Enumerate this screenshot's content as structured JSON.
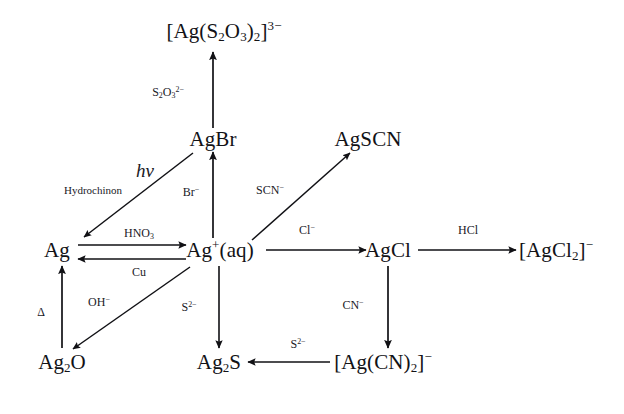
{
  "diagram": {
    "background_color": "#ffffff",
    "stroke_color": "#111115",
    "nodes": [
      {
        "id": "thio",
        "label": "[Ag(S2O3)2]3-",
        "html": "[Ag(S<sub>2</sub>O<sub>3</sub>)<sub>2</sub>]<sup>3−</sup>",
        "x": 224,
        "y": 31
      },
      {
        "id": "agbr",
        "label": "AgBr",
        "html": "AgBr",
        "x": 213,
        "y": 139
      },
      {
        "id": "agscn",
        "label": "AgSCN",
        "html": "AgSCN",
        "x": 368,
        "y": 139
      },
      {
        "id": "ag",
        "label": "Ag",
        "html": "Ag",
        "x": 57,
        "y": 250
      },
      {
        "id": "agaq",
        "label": "Ag+(aq)",
        "html": "Ag<sup>+</sup>(aq)",
        "x": 220,
        "y": 250
      },
      {
        "id": "agcl",
        "label": "AgCl",
        "html": "AgCl",
        "x": 388,
        "y": 250
      },
      {
        "id": "agcl2",
        "label": "[AgCl2]-",
        "html": "[AgCl<sub>2</sub>]<sup>−</sup>",
        "x": 556,
        "y": 250
      },
      {
        "id": "ag2o",
        "label": "Ag2O",
        "html": "Ag<sub>2</sub>O",
        "x": 62,
        "y": 362
      },
      {
        "id": "ag2s",
        "label": "Ag2S",
        "html": "Ag<sub>2</sub>S",
        "x": 219,
        "y": 362
      },
      {
        "id": "agcn2",
        "label": "[Ag(CN)2]-",
        "html": "[Ag(CN)<sub>2</sub>]<sup>−</sup>",
        "x": 383,
        "y": 362
      }
    ],
    "edges": [
      {
        "id": "e-agbr-thio",
        "from": "agbr",
        "to": "thio",
        "reagent": "S2O32-",
        "reagent_html": "S<sub>2</sub>O<sub>3</sub><sup>2−</sup>",
        "style": "sym",
        "lx": 168,
        "ly": 92,
        "x1": 213,
        "y1": 128,
        "x2": 213,
        "y2": 52
      },
      {
        "id": "e-agaq-agbr",
        "from": "agaq",
        "to": "agbr",
        "reagent": "Br-",
        "reagent_html": "Br<sup>−</sup>",
        "style": "sym",
        "lx": 191,
        "ly": 192,
        "x1": 213,
        "y1": 238,
        "x2": 213,
        "y2": 152
      },
      {
        "id": "e-agbr-ag",
        "from": "agbr",
        "to": "ag",
        "reagent": "hv",
        "reagent_html": "hν",
        "style": "hv",
        "lx": 145,
        "ly": 170,
        "x1": 193,
        "y1": 153,
        "x2": 84,
        "y2": 237
      },
      {
        "id": "e-agbr-ag-2",
        "from": "agbr",
        "to": "ag",
        "reagent": "Hydrochinon",
        "reagent_html": "Hydrochinon",
        "style": "small",
        "lx": 93,
        "ly": 190,
        "x1": null,
        "y1": null,
        "x2": null,
        "y2": null
      },
      {
        "id": "e-agaq-agscn",
        "from": "agaq",
        "to": "agscn",
        "reagent": "SCN-",
        "reagent_html": "SCN<sup>−</sup>",
        "style": "sym",
        "lx": 270,
        "ly": 190,
        "x1": 252,
        "y1": 238,
        "x2": 350,
        "y2": 153
      },
      {
        "id": "e-ag-agaq",
        "from": "ag",
        "to": "agaq",
        "reagent": "HNO3",
        "reagent_html": "HNO<sub>3</sub>",
        "style": "sym",
        "lx": 139,
        "ly": 233,
        "x1": 78,
        "y1": 245,
        "x2": 186,
        "y2": 245
      },
      {
        "id": "e-agaq-ag",
        "from": "agaq",
        "to": "ag",
        "reagent": "Cu",
        "reagent_html": "Cu",
        "style": "sym",
        "lx": 139,
        "ly": 272,
        "x1": 186,
        "y1": 259,
        "x2": 78,
        "y2": 259
      },
      {
        "id": "e-agaq-agcl",
        "from": "agaq",
        "to": "agcl",
        "reagent": "Cl-",
        "reagent_html": "Cl<sup>−</sup>",
        "style": "sym",
        "lx": 307,
        "ly": 230,
        "x1": 266,
        "y1": 250,
        "x2": 366,
        "y2": 250
      },
      {
        "id": "e-agcl-agcl2",
        "from": "agcl",
        "to": "agcl2",
        "reagent": "HCl",
        "reagent_html": "HCl",
        "style": "sym",
        "lx": 468,
        "ly": 230,
        "x1": 418,
        "y1": 250,
        "x2": 516,
        "y2": 250
      },
      {
        "id": "e-ag2o-ag",
        "from": "ag2o",
        "to": "ag",
        "reagent": "D",
        "reagent_html": "Δ",
        "style": "sym",
        "lx": 41,
        "ly": 312,
        "x1": 62,
        "y1": 348,
        "x2": 62,
        "y2": 266
      },
      {
        "id": "e-agaq-ag2o",
        "from": "agaq",
        "to": "ag2o",
        "reagent": "OH-",
        "reagent_html": "OH<sup>−</sup>",
        "style": "sym",
        "lx": 99,
        "ly": 302,
        "x1": 190,
        "y1": 267,
        "x2": 73,
        "y2": 349
      },
      {
        "id": "e-agaq-ag2s",
        "from": "agaq",
        "to": "ag2s",
        "reagent": "S2-",
        "reagent_html": "S<sup>2−</sup>",
        "style": "sym",
        "lx": 189,
        "ly": 307,
        "x1": 219,
        "y1": 266,
        "x2": 219,
        "y2": 348
      },
      {
        "id": "e-agcl-agcn2",
        "from": "agcl",
        "to": "agcn2",
        "reagent": "CN-",
        "reagent_html": "CN<sup>−</sup>",
        "style": "sym",
        "lx": 353,
        "ly": 305,
        "x1": 388,
        "y1": 266,
        "x2": 388,
        "y2": 348
      },
      {
        "id": "e-agcn2-ag2s",
        "from": "agcn2",
        "to": "ag2s",
        "reagent": "S2-",
        "reagent_html": "S<sup>2−</sup>",
        "style": "sym",
        "lx": 298,
        "ly": 344,
        "x1": 330,
        "y1": 362,
        "x2": 248,
        "y2": 362
      }
    ]
  }
}
